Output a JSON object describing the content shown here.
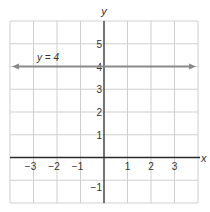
{
  "chart_data": {
    "type": "line",
    "title": "",
    "xlabel": "x",
    "ylabel": "y",
    "xlim": [
      -4,
      4
    ],
    "ylim": [
      -2,
      6
    ],
    "grid": true,
    "x_ticks": [
      -3,
      -2,
      -1,
      1,
      2,
      3
    ],
    "x_tick_labels": [
      "−3",
      "−2",
      "−1",
      "1",
      "2",
      "3"
    ],
    "y_ticks": [
      -1,
      1,
      2,
      3,
      4,
      5
    ],
    "y_tick_labels": [
      "−1",
      "1",
      "2",
      "3",
      "4",
      "5"
    ],
    "series": [
      {
        "name": "y = 4",
        "equation": "y = 4",
        "x": [
          -4,
          4
        ],
        "y": [
          4,
          4
        ],
        "style": "horizontal line with arrows at both ends",
        "color": "#8a8a8a"
      }
    ],
    "annotations": [
      {
        "text": "y = 4",
        "x": -3,
        "y": 4.4
      }
    ]
  },
  "colors": {
    "grid": "#cfcfcf",
    "axis": "#2b2b2b",
    "line": "#8a8a8a",
    "text": "#333333"
  }
}
